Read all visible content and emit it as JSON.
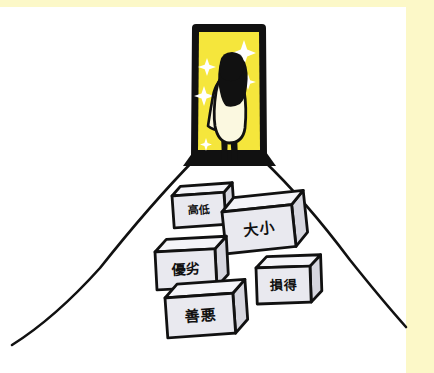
{
  "illustration": {
    "title": "Woman standing at a glowing doorway with labelled blocks on the floor",
    "caption": "",
    "background_color": "#ffffff",
    "frame_band_color": "#FCF8C8",
    "ink_color": "#111111"
  },
  "doorway": {
    "name": "glowing-doorway",
    "fill_color": "#F5E63C",
    "frame_color": "#111111",
    "sparkle_color": "#ffffff",
    "sparkle_count": 5
  },
  "figure": {
    "name": "woman-figure",
    "hair_color": "#111111",
    "dress_color": "#FBF8E0",
    "leg_color": "#111111"
  },
  "floor": {
    "name": "floor-perspective",
    "line_color": "#111111",
    "left_line": [
      196,
      158,
      12,
      345
    ],
    "right_line": [
      263,
      160,
      406,
      327
    ]
  },
  "blocks": [
    {
      "id": "block-kotei",
      "label": "高低",
      "reading": "kotei",
      "meaning": "high / low",
      "x": 172,
      "y": 196,
      "w": 52,
      "h": 32,
      "depth": 9,
      "rotate": -4,
      "face_color": "#E9E9EF",
      "top_color": "#F4F4F8",
      "side_color": "#D6D6DE",
      "font_size": 11
    },
    {
      "id": "block-daisho",
      "label": "大小",
      "reading": "daisho",
      "meaning": "big / small",
      "x": 222,
      "y": 212,
      "w": 70,
      "h": 42,
      "depth": 13,
      "rotate": -6,
      "face_color": "#E9E9EF",
      "top_color": "#F4F4F8",
      "side_color": "#D6D6DE",
      "font_size": 15
    },
    {
      "id": "block-yuretsu",
      "label": "優劣",
      "reading": "yūretsu",
      "meaning": "superior / inferior",
      "x": 155,
      "y": 252,
      "w": 60,
      "h": 38,
      "depth": 12,
      "rotate": -3,
      "face_color": "#E9E9EF",
      "top_color": "#F4F4F8",
      "side_color": "#D6D6DE",
      "font_size": 14
    },
    {
      "id": "block-sontoku",
      "label": "損得",
      "reading": "sontoku",
      "meaning": "loss / gain",
      "x": 256,
      "y": 268,
      "w": 54,
      "h": 36,
      "depth": 11,
      "rotate": -2,
      "face_color": "#E9E9EF",
      "top_color": "#F4F4F8",
      "side_color": "#D6D6DE",
      "font_size": 13
    },
    {
      "id": "block-zenaku",
      "label": "善悪",
      "reading": "zen'aku",
      "meaning": "good / evil",
      "x": 165,
      "y": 298,
      "w": 68,
      "h": 40,
      "depth": 13,
      "rotate": -4,
      "face_color": "#E9E9EF",
      "top_color": "#F4F4F8",
      "side_color": "#D6D6DE",
      "font_size": 15
    }
  ]
}
